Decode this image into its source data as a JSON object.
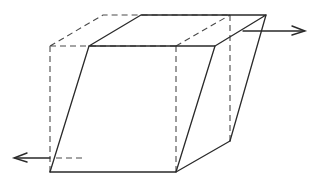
{
  "diagram": {
    "type": "line-drawing",
    "colors": {
      "line": "#2a2a2a",
      "dashed": "#4a4a4a",
      "background": "#ffffff"
    },
    "original_cube": {
      "style": "dashed",
      "vertices": {
        "front_top_left": [
          50,
          46
        ],
        "front_top_right": [
          176,
          46
        ],
        "back_top_left": [
          103,
          15
        ],
        "back_top_right": [
          230,
          15
        ],
        "front_bottom_left": [
          50,
          172
        ],
        "front_bottom_right": [
          176,
          172
        ],
        "back_bottom_right": [
          230,
          141
        ]
      }
    },
    "sheared_solid": {
      "style": "solid",
      "vertices": {
        "front_top_left": [
          89,
          46
        ],
        "front_top_right": [
          215,
          46
        ],
        "back_top_left": [
          141,
          15
        ],
        "back_top_right": [
          266,
          15
        ],
        "front_bottom_left": [
          50,
          172
        ],
        "front_bottom_right": [
          176,
          172
        ],
        "back_bottom_right": [
          230,
          141
        ]
      }
    },
    "forces": [
      {
        "name": "top-shear-force",
        "direction": "right",
        "from": [
          243,
          31
        ],
        "to": [
          305,
          31
        ]
      },
      {
        "name": "bottom-shear-force",
        "direction": "left",
        "from": [
          82,
          158
        ],
        "to": [
          14,
          158
        ]
      }
    ]
  }
}
